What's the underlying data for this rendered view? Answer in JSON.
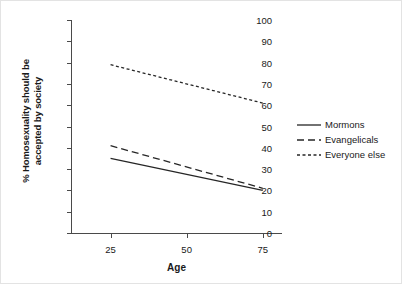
{
  "chart_data": {
    "type": "line",
    "title": "",
    "xlabel": "Age",
    "ylabel": "% Homosexuality should be accepted by society",
    "ylabel_line1": "% Homosexuality should be",
    "ylabel_line2": "accepted by society",
    "x": [
      25,
      75
    ],
    "xticks": [
      25,
      50,
      75
    ],
    "xtick_labels": [
      "25",
      "50",
      "75"
    ],
    "xlim": [
      12,
      81
    ],
    "yticks": [
      0,
      10,
      20,
      30,
      40,
      50,
      60,
      70,
      80,
      90,
      100
    ],
    "ytick_labels": [
      "0",
      "10",
      "20",
      "30",
      "40",
      "50",
      "60",
      "70",
      "80",
      "90",
      "100"
    ],
    "ylim": [
      0,
      100
    ],
    "grid": false,
    "legend_position": "right",
    "series": [
      {
        "name": "Mormons",
        "style": "solid",
        "color": "#262626",
        "x": [
          25,
          75
        ],
        "values": [
          35,
          20
        ]
      },
      {
        "name": "Evangelicals",
        "style": "dashed",
        "color": "#262626",
        "x": [
          25,
          75
        ],
        "values": [
          41,
          21
        ]
      },
      {
        "name": "Everyone else",
        "style": "dotted",
        "color": "#262626",
        "x": [
          25,
          75
        ],
        "values": [
          79,
          61
        ]
      }
    ]
  },
  "legend": {
    "items": [
      {
        "label": "Mormons",
        "style": "solid"
      },
      {
        "label": "Evangelicals",
        "style": "dashed"
      },
      {
        "label": "Everyone else",
        "style": "dotted"
      }
    ]
  },
  "colors": {
    "axis": "#4a4a4a",
    "line": "#262626",
    "background": "#ffffff",
    "border": "#e3e3e3"
  }
}
